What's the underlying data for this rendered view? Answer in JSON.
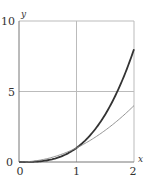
{
  "chart_data": {
    "type": "line",
    "title": "",
    "xlabel": "x",
    "ylabel": "y",
    "xlim": [
      0,
      2
    ],
    "ylim": [
      0,
      10
    ],
    "grid": true,
    "x_ticks": [
      "0",
      "1",
      "2"
    ],
    "y_ticks": [
      "0",
      "5",
      "10"
    ],
    "series": [
      {
        "name": "y = x^3",
        "style": "thick dark",
        "color": "#333333",
        "x": [
          0,
          0.25,
          0.5,
          0.75,
          1,
          1.25,
          1.5,
          1.75,
          2
        ],
        "values": [
          0,
          0.016,
          0.125,
          0.422,
          1,
          1.953,
          3.375,
          5.359,
          8
        ]
      },
      {
        "name": "y = x^2",
        "style": "thin gray",
        "color": "#888888",
        "x": [
          0,
          0.25,
          0.5,
          0.75,
          1,
          1.25,
          1.5,
          1.75,
          2
        ],
        "values": [
          0,
          0.0625,
          0.25,
          0.5625,
          1,
          1.5625,
          2.25,
          3.0625,
          4
        ]
      }
    ]
  }
}
